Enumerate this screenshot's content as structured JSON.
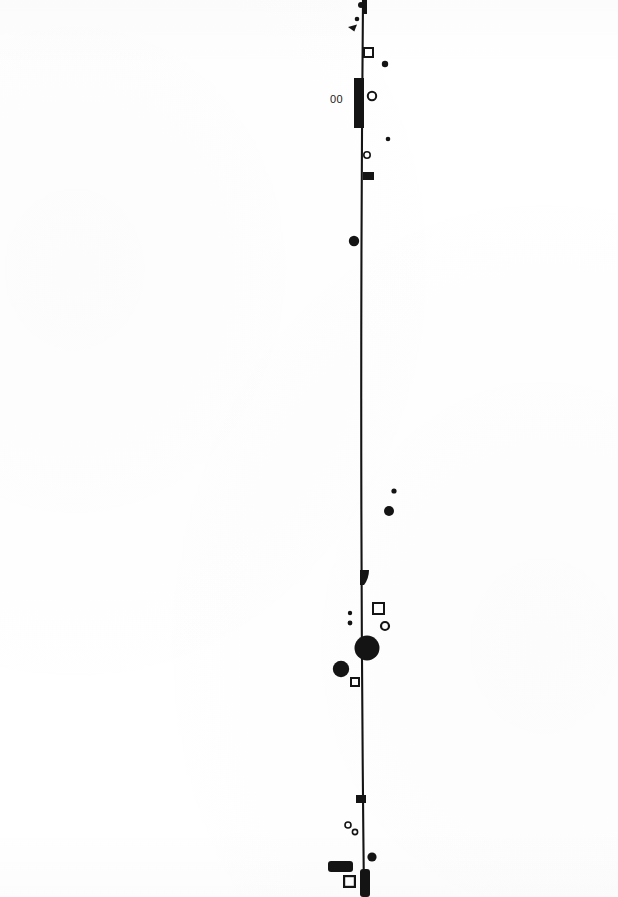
{
  "page": {
    "width": 618,
    "height": 897,
    "background_color": "#ffffff",
    "ink_color": "#141414"
  },
  "text": {
    "numeral_00": "00"
  },
  "annotations": {
    "numeral_00_position": {
      "x": 330,
      "y": 93
    }
  },
  "chart_data": {
    "type": "scatter",
    "title": "",
    "xlabel": "",
    "ylabel": "",
    "xlim": [
      0,
      618
    ],
    "ylim": [
      0,
      897
    ],
    "grid": false,
    "legend": "none",
    "vertical_rule": {
      "x_top": 363,
      "y_top": 0,
      "x_bottom": 364,
      "y_bottom": 897,
      "x_mid": 359,
      "stroke_width": 2.1,
      "color": "#141414"
    },
    "rule_cap_top": {
      "x": 362,
      "y": 0,
      "width": 5,
      "height": 14
    },
    "rule_cap_bottom": {
      "x": 360,
      "y": 869,
      "width": 10,
      "height": 28
    },
    "marks": [
      {
        "id": "m01",
        "shape": "dot",
        "cx": 361,
        "cy": 5,
        "r": 3.0
      },
      {
        "id": "m02",
        "shape": "dot",
        "cx": 357,
        "cy": 19,
        "r": 2.3
      },
      {
        "id": "m03",
        "shape": "wedge",
        "cx": 348,
        "cy": 27,
        "w": 9,
        "h": 7
      },
      {
        "id": "m04",
        "shape": "square-outline",
        "x": 363,
        "y": 47,
        "w": 11,
        "h": 11,
        "stroke": 2.0
      },
      {
        "id": "m05",
        "shape": "dot",
        "cx": 385,
        "cy": 64,
        "r": 3.2
      },
      {
        "id": "m06",
        "shape": "thick-bar",
        "x": 354,
        "y": 78,
        "w": 10,
        "h": 50
      },
      {
        "id": "m07",
        "shape": "ring",
        "cx": 372,
        "cy": 96,
        "r": 4.2,
        "stroke": 2.0
      },
      {
        "id": "m08",
        "shape": "dot",
        "cx": 388,
        "cy": 139,
        "r": 2.3
      },
      {
        "id": "m09",
        "shape": "ring",
        "cx": 367,
        "cy": 155,
        "r": 3.2,
        "stroke": 1.6
      },
      {
        "id": "m10",
        "shape": "rect",
        "x": 363,
        "y": 172,
        "w": 11,
        "h": 8
      },
      {
        "id": "m11",
        "shape": "dot",
        "cx": 354,
        "cy": 241,
        "r": 5.2
      },
      {
        "id": "m12",
        "shape": "dot",
        "cx": 394,
        "cy": 491,
        "r": 2.6
      },
      {
        "id": "m13",
        "shape": "dot",
        "cx": 389,
        "cy": 511,
        "r": 5.0
      },
      {
        "id": "m14",
        "shape": "blob",
        "x": 360,
        "y": 570,
        "w": 9,
        "h": 15
      },
      {
        "id": "m15",
        "shape": "dot",
        "cx": 350,
        "cy": 613,
        "r": 2.2
      },
      {
        "id": "m16",
        "shape": "dot",
        "cx": 350,
        "cy": 623,
        "r": 2.4
      },
      {
        "id": "m17",
        "shape": "square-outline",
        "x": 372,
        "y": 602,
        "w": 13,
        "h": 13,
        "stroke": 2.0
      },
      {
        "id": "m18",
        "shape": "ring",
        "cx": 385,
        "cy": 626,
        "r": 4.0,
        "stroke": 2.2
      },
      {
        "id": "m19",
        "shape": "dot",
        "cx": 367,
        "cy": 648,
        "r": 12.5
      },
      {
        "id": "m20",
        "shape": "dot",
        "cx": 341,
        "cy": 669,
        "r": 8.2
      },
      {
        "id": "m21",
        "shape": "square-outline",
        "x": 350,
        "y": 677,
        "w": 10,
        "h": 10,
        "stroke": 2.0
      },
      {
        "id": "m22",
        "shape": "rect",
        "x": 356,
        "y": 795,
        "w": 10,
        "h": 8
      },
      {
        "id": "m23",
        "shape": "ring",
        "cx": 348,
        "cy": 825,
        "r": 3.0,
        "stroke": 1.6
      },
      {
        "id": "m24",
        "shape": "ring",
        "cx": 355,
        "cy": 832,
        "r": 2.6,
        "stroke": 1.6
      },
      {
        "id": "m25",
        "shape": "dot",
        "cx": 372,
        "cy": 857,
        "r": 4.6
      },
      {
        "id": "m26",
        "shape": "rounded-rect",
        "x": 328,
        "y": 861,
        "w": 25,
        "h": 11,
        "radius": 3
      },
      {
        "id": "m27",
        "shape": "square-outline",
        "x": 343,
        "y": 875,
        "w": 13,
        "h": 13,
        "stroke": 2.2
      }
    ]
  }
}
